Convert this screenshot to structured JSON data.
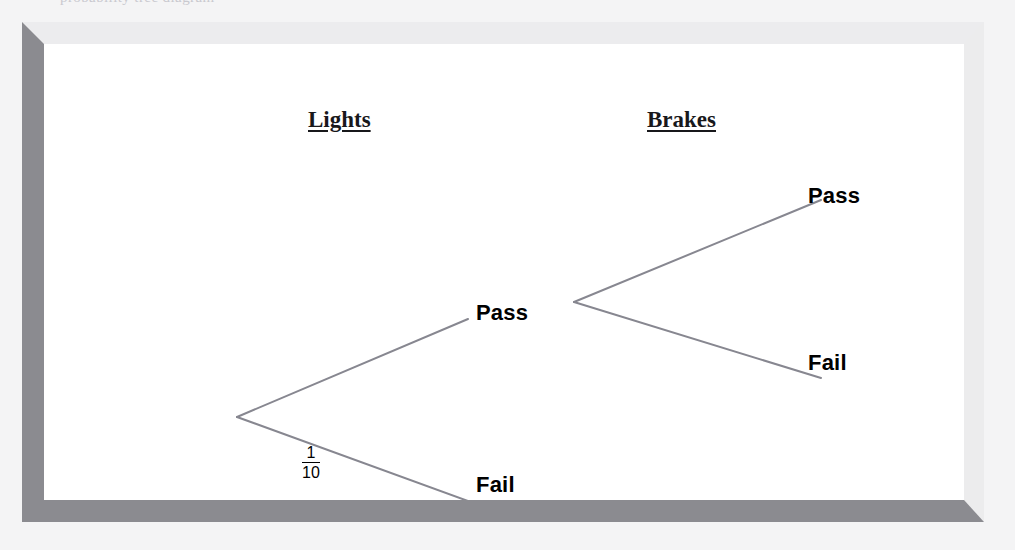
{
  "page": {
    "background_color": "#f4f4f5",
    "top_cut_text": "probability tree diagram"
  },
  "frame": {
    "name": "beveled-picture-frame",
    "fill_color": "#ffffff",
    "bevel_light_color": "#ececee",
    "bevel_dark_color": "#8b8b90"
  },
  "diagram": {
    "type": "probability-tree",
    "line_color": "#878790",
    "line_width": 2,
    "headings": [
      {
        "id": "lights",
        "label": "Lights"
      },
      {
        "id": "brakes",
        "label": "Brakes"
      }
    ],
    "nodes": [
      {
        "id": "root",
        "stage": 0,
        "label": "",
        "x": 193,
        "y": 373
      },
      {
        "id": "lights-pass",
        "stage": 1,
        "label": "Pass",
        "x": 530,
        "y": 258
      },
      {
        "id": "lights-fail",
        "stage": 1,
        "label": "Fail",
        "x": 447,
        "y": 443
      },
      {
        "id": "brakes-pass",
        "stage": 2,
        "label": "Pass",
        "x": 781,
        "y": 154
      },
      {
        "id": "brakes-fail",
        "stage": 2,
        "label": "Fail",
        "x": 781,
        "y": 321
      }
    ],
    "branches": [
      {
        "id": "root-to-lights-pass",
        "from": "root",
        "to": "lights-pass",
        "x1": 193,
        "y1": 373,
        "x2": 424,
        "y2": 275,
        "probability": null
      },
      {
        "id": "root-to-lights-fail",
        "from": "root",
        "to": "lights-fail",
        "x1": 193,
        "y1": 373,
        "x2": 424,
        "y2": 457,
        "probability": {
          "numerator": "1",
          "denominator": "10",
          "text": "1/10"
        }
      },
      {
        "id": "lights-pass-to-brakes-pass",
        "from": "lights-pass",
        "to": "brakes-pass",
        "x1": 530,
        "y1": 258,
        "x2": 777,
        "y2": 156,
        "probability": null
      },
      {
        "id": "lights-pass-to-brakes-fail",
        "from": "lights-pass",
        "to": "brakes-fail",
        "x1": 530,
        "y1": 258,
        "x2": 777,
        "y2": 334,
        "probability": null
      }
    ]
  }
}
